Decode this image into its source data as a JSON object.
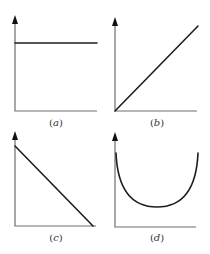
{
  "panels": [
    {
      "id": "a",
      "label_open": "(",
      "label_letter": "a",
      "label_close": ")",
      "shape": "horizontal-line",
      "description": "constant value"
    },
    {
      "id": "b",
      "label_open": "(",
      "label_letter": "b",
      "label_close": ")",
      "shape": "increasing-line",
      "description": "linear increase from origin"
    },
    {
      "id": "c",
      "label_open": "(",
      "label_letter": "c",
      "label_close": ")",
      "shape": "decreasing-line",
      "description": "linear decrease to x-axis"
    },
    {
      "id": "d",
      "label_open": "(",
      "label_letter": "d",
      "label_close": ")",
      "shape": "u-curve",
      "description": "U-shaped curve with minimum in middle"
    }
  ],
  "colors": {
    "axis": "#6e6e6e",
    "curve": "#1e1e1e",
    "background": "#ffffff"
  }
}
